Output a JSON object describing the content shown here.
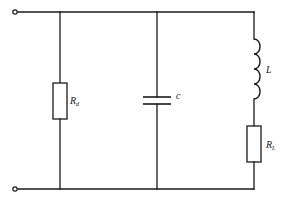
{
  "diagram": {
    "type": "circuit-schematic",
    "colors": {
      "line": "#1a1a1a",
      "background": "#ffffff"
    },
    "terminals": [
      {
        "id": "top-terminal",
        "position": "top-left"
      },
      {
        "id": "bottom-terminal",
        "position": "bottom-left"
      }
    ],
    "branches": [
      {
        "id": "branch-rd",
        "component": "resistor",
        "label": {
          "main": "R",
          "sub": "d"
        }
      },
      {
        "id": "branch-c",
        "component": "capacitor",
        "label": {
          "main": "c",
          "sub": ""
        }
      },
      {
        "id": "branch-lrl",
        "components": [
          {
            "component": "inductor",
            "label": {
              "main": "L",
              "sub": ""
            }
          },
          {
            "component": "resistor",
            "label": {
              "main": "R",
              "sub": "L"
            }
          }
        ]
      }
    ]
  }
}
